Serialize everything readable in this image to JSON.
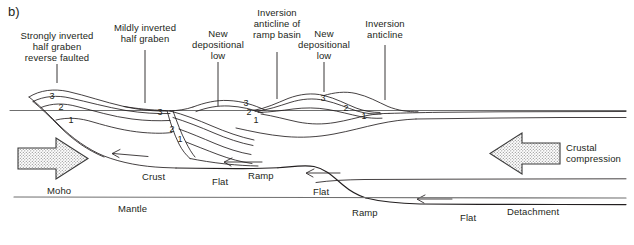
{
  "figure": {
    "panel_label": "b)",
    "caption_labels": {
      "strongly_inverted": "Strongly inverted\nhalf graben\nreverse faulted",
      "mildly_inverted": "Mildly inverted\nhalf graben",
      "new_low_1": "New\ndepositional\nlow",
      "inversion_anticline_ramp": "Inversion\nanticline of\nramp basin",
      "new_low_2": "New\ndepositional\nlow",
      "inversion_anticline": "Inversion\nanticline"
    },
    "body_labels": {
      "moho": "Moho",
      "crust": "Crust",
      "mantle": "Mantle",
      "detachment": "Detachment",
      "flat_1": "Flat",
      "flat_2": "Flat",
      "flat_3": "Flat",
      "ramp_1": "Ramp",
      "ramp_2": "Ramp",
      "crustal_compression": "Crustal\ncompression"
    },
    "stratigraphic_units": {
      "graben_1": [
        "3",
        "2",
        "1"
      ],
      "graben_2": [
        "3",
        "2",
        "1"
      ],
      "anticline_ramp_basin": [
        "3",
        "2",
        "1"
      ],
      "anticline_right": [
        "3",
        "2",
        "1"
      ]
    },
    "arrows": {
      "left_arrow_direction": "right",
      "right_arrow_direction": "left"
    },
    "colors": {
      "line": "#231f20",
      "text": "#231f20",
      "background": "#ffffff",
      "arrow_fill": "#d9d9d9",
      "datum_line": "#6b6b6b"
    }
  }
}
